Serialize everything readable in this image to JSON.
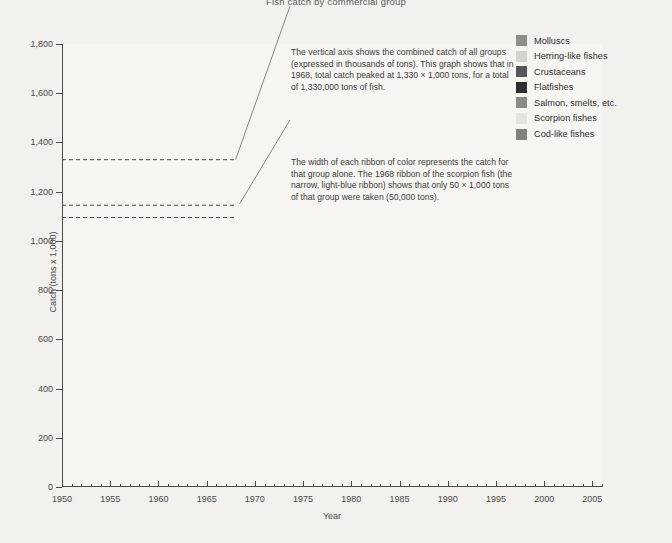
{
  "title": "Fish catch by commercial group",
  "axis": {
    "y_title": "Catch (tons x 1,000)",
    "x_title": "Year",
    "y_ticks": [
      "1,800",
      "1,600",
      "1,400",
      "1,200",
      "1,000",
      "800",
      "600",
      "400",
      "200",
      "0"
    ],
    "x_ticks": [
      "1950",
      "1955",
      "1960",
      "1965",
      "1970",
      "1975",
      "1980",
      "1985",
      "1990",
      "1995",
      "2000",
      "2005"
    ]
  },
  "annotations": [
    {
      "id": "peak-total-note",
      "text": "The vertical axis shows the combined catch of all groups (expressed in thousands of tons). This graph shows that in 1968, total catch peaked at 1,330 × 1,000 tons, for a total of 1,330,000 tons of fish."
    },
    {
      "id": "ribbon-width-note",
      "text": "The width of each ribbon of color represents the catch for that group alone. The 1968 ribbon of the scorpion fish (the narrow, light-blue ribbon) shows that only 50 × 1,000 tons of that group were taken (50,000 tons)."
    }
  ],
  "legend": {
    "items": [
      {
        "label": "Molluscs",
        "color": "#8d8d8a"
      },
      {
        "label": "Herring-like fishes",
        "color": "#d5d4ce"
      },
      {
        "label": "Crustaceans",
        "color": "#56565a"
      },
      {
        "label": "Flatfishes",
        "color": "#2e2e30"
      },
      {
        "label": "Salmon, smelts, etc.",
        "color": "#8a8a87"
      },
      {
        "label": "Scorpion fishes",
        "color": "#e4e3dd"
      },
      {
        "label": "Cod-like fishes",
        "color": "#80807d"
      }
    ]
  },
  "guides": [
    {
      "id": "guide-total-peak",
      "value": 1330
    },
    {
      "id": "guide-scorpion-top",
      "value": 1145
    },
    {
      "id": "guide-scorpion-base",
      "value": 1095
    }
  ],
  "chart_data": {
    "type": "area",
    "stacked": true,
    "title": "Fish catch by commercial group",
    "xlabel": "Year",
    "ylabel": "Catch (tons x 1,000)",
    "xlim": [
      1950,
      2006
    ],
    "ylim": [
      0,
      1800
    ],
    "ytick_step": 200,
    "grid": false,
    "legend_position": "top-right",
    "x": [
      1950,
      1951,
      1952,
      1953,
      1954,
      1955,
      1956,
      1957,
      1958,
      1959,
      1960,
      1961,
      1962,
      1963,
      1964,
      1965,
      1966,
      1967,
      1968,
      1969,
      1970,
      1971,
      1972,
      1973,
      1974,
      1975,
      1976,
      1977,
      1978,
      1979,
      1980,
      1981,
      1982,
      1983,
      1984,
      1985,
      1986,
      1987,
      1988,
      1989,
      1990,
      1991,
      1992,
      1993,
      1994,
      1995,
      1996,
      1997,
      1998,
      1999,
      2000,
      2001,
      2002,
      2003,
      2004,
      2005
    ],
    "series": [
      {
        "name": "Cod-like fishes",
        "color": "#80807d",
        "values": [
          250,
          270,
          300,
          330,
          350,
          380,
          430,
          470,
          500,
          560,
          610,
          640,
          620,
          680,
          720,
          700,
          760,
          880,
          1130,
          870,
          820,
          790,
          700,
          600,
          520,
          470,
          440,
          470,
          490,
          520,
          560,
          580,
          620,
          660,
          700,
          760,
          720,
          700,
          690,
          620,
          480,
          300,
          170,
          110,
          80,
          80,
          90,
          100,
          110,
          115,
          120,
          115,
          110,
          105,
          100,
          95
        ]
      },
      {
        "name": "Scorpion fishes",
        "color": "#e4e3dd",
        "values": [
          14,
          15,
          16,
          18,
          19,
          20,
          22,
          24,
          26,
          30,
          33,
          35,
          34,
          38,
          41,
          40,
          43,
          47,
          50,
          44,
          42,
          40,
          37,
          33,
          29,
          26,
          24,
          26,
          27,
          29,
          31,
          33,
          36,
          39,
          42,
          46,
          44,
          42,
          41,
          37,
          29,
          19,
          12,
          9,
          7,
          7,
          8,
          9,
          10,
          10,
          11,
          10,
          10,
          9,
          9,
          9
        ]
      },
      {
        "name": "Salmon, smelts, etc.",
        "color": "#8a8a87",
        "values": [
          10,
          11,
          12,
          13,
          14,
          15,
          17,
          18,
          19,
          22,
          24,
          25,
          24,
          27,
          29,
          28,
          31,
          34,
          36,
          32,
          30,
          29,
          26,
          23,
          20,
          18,
          17,
          18,
          19,
          20,
          22,
          23,
          25,
          27,
          30,
          33,
          31,
          30,
          29,
          26,
          21,
          14,
          9,
          7,
          5,
          5,
          6,
          7,
          7,
          8,
          8,
          8,
          7,
          7,
          7,
          7
        ]
      },
      {
        "name": "Flatfishes",
        "color": "#2e2e30",
        "values": [
          12,
          13,
          14,
          15,
          17,
          18,
          20,
          22,
          24,
          27,
          30,
          32,
          31,
          34,
          37,
          36,
          39,
          46,
          64,
          48,
          44,
          41,
          37,
          32,
          27,
          24,
          22,
          24,
          26,
          28,
          31,
          34,
          38,
          42,
          47,
          53,
          50,
          48,
          47,
          42,
          33,
          21,
          13,
          10,
          9,
          10,
          12,
          16,
          20,
          22,
          24,
          23,
          21,
          19,
          18,
          17
        ]
      },
      {
        "name": "Crustaceans",
        "color": "#56565a",
        "values": [
          9,
          10,
          11,
          12,
          13,
          14,
          16,
          17,
          19,
          21,
          23,
          25,
          24,
          27,
          29,
          28,
          31,
          36,
          44,
          38,
          35,
          33,
          30,
          26,
          22,
          20,
          19,
          20,
          22,
          24,
          27,
          30,
          34,
          38,
          43,
          49,
          47,
          45,
          44,
          39,
          31,
          22,
          16,
          18,
          24,
          34,
          48,
          62,
          74,
          80,
          84,
          82,
          80,
          78,
          76,
          74
        ]
      },
      {
        "name": "Herring-like fishes",
        "color": "#d5d4ce",
        "values": [
          8,
          9,
          10,
          11,
          12,
          13,
          14,
          15,
          17,
          19,
          21,
          22,
          21,
          24,
          26,
          25,
          28,
          32,
          40,
          34,
          32,
          30,
          27,
          24,
          20,
          18,
          17,
          18,
          20,
          22,
          24,
          26,
          30,
          33,
          38,
          43,
          41,
          40,
          39,
          35,
          28,
          19,
          13,
          12,
          13,
          16,
          20,
          24,
          28,
          30,
          32,
          31,
          30,
          29,
          28,
          27
        ]
      },
      {
        "name": "Molluscs",
        "color": "#8d8d8a",
        "values": [
          13,
          14,
          15,
          17,
          18,
          20,
          22,
          24,
          26,
          29,
          32,
          34,
          33,
          36,
          39,
          38,
          42,
          48,
          60,
          50,
          46,
          43,
          39,
          34,
          29,
          26,
          24,
          26,
          28,
          31,
          34,
          38,
          43,
          48,
          54,
          62,
          59,
          57,
          56,
          50,
          40,
          30,
          26,
          30,
          40,
          55,
          75,
          92,
          104,
          112,
          118,
          114,
          110,
          106,
          102,
          98
        ]
      }
    ],
    "totals_note": {
      "1968": 1330,
      "scorpion_1968": 50
    }
  }
}
